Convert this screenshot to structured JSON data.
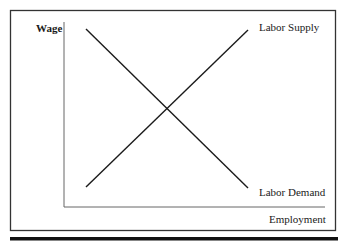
{
  "diagram": {
    "y_axis_label": "Wage",
    "x_axis_label": "Employment",
    "curves": [
      {
        "name": "Labor Supply",
        "direction": "upward-sloping"
      },
      {
        "name": "Labor Demand",
        "direction": "downward-sloping"
      }
    ]
  },
  "colors": {
    "line": "#1a1a1a",
    "axis": "#555555",
    "frame": "#333333"
  }
}
